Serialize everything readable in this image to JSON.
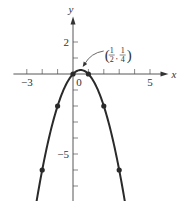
{
  "chart_data": {
    "type": "line",
    "title": "",
    "function": "y = x - x^2",
    "xlabel": "x",
    "ylabel": "y",
    "xlim": [
      -4,
      6.2
    ],
    "ylim": [
      -8.6,
      3.6
    ],
    "x_ticks": [
      -3,
      -2,
      -1,
      0,
      1,
      2,
      3,
      4,
      5
    ],
    "x_tick_labels": [
      {
        "value": -3,
        "label": "−3"
      },
      {
        "value": 0,
        "label": "0"
      },
      {
        "value": 5,
        "label": "5"
      }
    ],
    "y_ticks": [
      2,
      1,
      -1,
      -2,
      -3,
      -4,
      -5,
      -6,
      -7,
      -8
    ],
    "y_tick_labels": [
      {
        "value": 2,
        "label": "2"
      },
      {
        "value": -5,
        "label": "−5"
      }
    ],
    "curve_domain": [
      -2.45,
      3.45
    ],
    "points": [
      {
        "x": -2,
        "y": -6
      },
      {
        "x": -1,
        "y": -2
      },
      {
        "x": 0,
        "y": 0
      },
      {
        "x": 1,
        "y": 0
      },
      {
        "x": 2,
        "y": -2
      },
      {
        "x": 3,
        "y": -6
      }
    ],
    "annotation": {
      "x": 0.5,
      "y": 0.25,
      "text": "(1/2, 1/4)",
      "x_num": "1",
      "x_den": "2",
      "y_num": "1",
      "y_den": "4"
    },
    "grid": false,
    "legend": "none"
  }
}
